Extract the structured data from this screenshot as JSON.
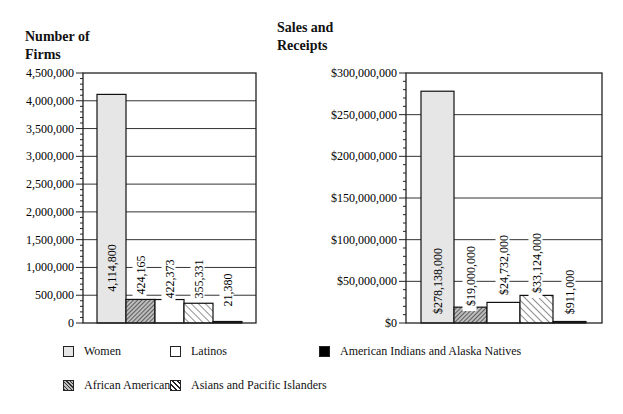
{
  "titles": {
    "left": "Number of Firms",
    "right": "Sales and Receipts"
  },
  "legend": [
    {
      "label": "Women",
      "fill": "women"
    },
    {
      "label": "Latinos",
      "fill": "latinos"
    },
    {
      "label": "American Indians and Alaska Natives",
      "fill": "natives"
    },
    {
      "label": "African Americans",
      "fill": "african"
    },
    {
      "label": "Asians and Pacific Islanders",
      "fill": "asian"
    }
  ],
  "colors": {
    "women": "#e6e6e6",
    "latinos": "#ffffff",
    "natives": "#000000",
    "axis": "#222222",
    "grid": "#333333"
  },
  "chart_data": [
    {
      "type": "bar",
      "title": "Number of Firms",
      "xlabel": "",
      "ylabel": "Number of Firms",
      "categories": [
        "Women",
        "African Americans",
        "Latinos",
        "Asians and Pacific Islanders",
        "American Indians and Alaska Natives"
      ],
      "values": [
        4114800,
        424165,
        422373,
        355331,
        21380
      ],
      "value_labels": [
        "4,114,800",
        "424,165",
        "422,373",
        "355,331",
        "21,380"
      ],
      "ylim": [
        0,
        4500000
      ],
      "yticks": [
        0,
        500000,
        1000000,
        1500000,
        2000000,
        2500000,
        3000000,
        3500000,
        4000000,
        4500000
      ],
      "ytick_labels": [
        "0",
        "500,000",
        "1,000,000",
        "1,500,000",
        "2,000,000",
        "2,500,000",
        "3,000,000",
        "3,500,000",
        "4,000,000",
        "4,500,000"
      ],
      "grid": true,
      "legend_position": "bottom"
    },
    {
      "type": "bar",
      "title": "Sales and Receipts",
      "xlabel": "",
      "ylabel": "Sales and Receipts",
      "categories": [
        "Women",
        "African Americans",
        "Latinos",
        "Asians and Pacific Islanders",
        "American Indians and Alaska Natives"
      ],
      "values": [
        278138000,
        19000000,
        24732000,
        33124000,
        911000
      ],
      "value_labels": [
        "$278,138,000",
        "$19,000,000",
        "$24,732,000",
        "$33,124,000",
        "$911,000"
      ],
      "ylim": [
        0,
        300000000
      ],
      "yticks": [
        0,
        50000000,
        100000000,
        150000000,
        200000000,
        250000000,
        300000000
      ],
      "ytick_labels": [
        "$0",
        "$50,000,000",
        "$100,000,000",
        "$150,000,000",
        "$200,000,000",
        "$250,000,000",
        "$300,000,000"
      ],
      "grid": true,
      "legend_position": "bottom"
    }
  ]
}
